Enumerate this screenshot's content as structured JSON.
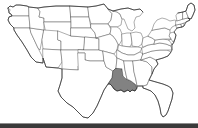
{
  "figure": {
    "kind": "map",
    "width": 198,
    "height": 128,
    "background_color": "#ffffff",
    "border_color": "#4a4a4a",
    "coastline_color": "#2e2e2e",
    "highlight_color": "#828282",
    "bottom_band_color": "#3a3a3a"
  },
  "map_data": {
    "region": "Contiguous United States",
    "projection_note": "simplified outline",
    "highlighted_states": [
      "Louisiana"
    ],
    "highlight_fill": "#828282",
    "default_fill": "#ffffff",
    "states": [
      {
        "code": "WA",
        "name": "Washington",
        "highlighted": false
      },
      {
        "code": "OR",
        "name": "Oregon",
        "highlighted": false
      },
      {
        "code": "CA",
        "name": "California",
        "highlighted": false
      },
      {
        "code": "NV",
        "name": "Nevada",
        "highlighted": false
      },
      {
        "code": "ID",
        "name": "Idaho",
        "highlighted": false
      },
      {
        "code": "MT",
        "name": "Montana",
        "highlighted": false
      },
      {
        "code": "WY",
        "name": "Wyoming",
        "highlighted": false
      },
      {
        "code": "UT",
        "name": "Utah",
        "highlighted": false
      },
      {
        "code": "AZ",
        "name": "Arizona",
        "highlighted": false
      },
      {
        "code": "CO",
        "name": "Colorado",
        "highlighted": false
      },
      {
        "code": "NM",
        "name": "New Mexico",
        "highlighted": false
      },
      {
        "code": "ND",
        "name": "North Dakota",
        "highlighted": false
      },
      {
        "code": "SD",
        "name": "South Dakota",
        "highlighted": false
      },
      {
        "code": "NE",
        "name": "Nebraska",
        "highlighted": false
      },
      {
        "code": "KS",
        "name": "Kansas",
        "highlighted": false
      },
      {
        "code": "OK",
        "name": "Oklahoma",
        "highlighted": false
      },
      {
        "code": "TX",
        "name": "Texas",
        "highlighted": false
      },
      {
        "code": "MN",
        "name": "Minnesota",
        "highlighted": false
      },
      {
        "code": "IA",
        "name": "Iowa",
        "highlighted": false
      },
      {
        "code": "MO",
        "name": "Missouri",
        "highlighted": false
      },
      {
        "code": "AR",
        "name": "Arkansas",
        "highlighted": false
      },
      {
        "code": "LA",
        "name": "Louisiana",
        "highlighted": true
      },
      {
        "code": "WI",
        "name": "Wisconsin",
        "highlighted": false
      },
      {
        "code": "IL",
        "name": "Illinois",
        "highlighted": false
      },
      {
        "code": "MI",
        "name": "Michigan",
        "highlighted": false
      },
      {
        "code": "IN",
        "name": "Indiana",
        "highlighted": false
      },
      {
        "code": "OH",
        "name": "Ohio",
        "highlighted": false
      },
      {
        "code": "KY",
        "name": "Kentucky",
        "highlighted": false
      },
      {
        "code": "TN",
        "name": "Tennessee",
        "highlighted": false
      },
      {
        "code": "MS",
        "name": "Mississippi",
        "highlighted": false
      },
      {
        "code": "AL",
        "name": "Alabama",
        "highlighted": false
      },
      {
        "code": "GA",
        "name": "Georgia",
        "highlighted": false
      },
      {
        "code": "FL",
        "name": "Florida",
        "highlighted": false
      },
      {
        "code": "SC",
        "name": "South Carolina",
        "highlighted": false
      },
      {
        "code": "NC",
        "name": "North Carolina",
        "highlighted": false
      },
      {
        "code": "VA",
        "name": "Virginia",
        "highlighted": false
      },
      {
        "code": "WV",
        "name": "West Virginia",
        "highlighted": false
      },
      {
        "code": "MD",
        "name": "Maryland",
        "highlighted": false
      },
      {
        "code": "DE",
        "name": "Delaware",
        "highlighted": false
      },
      {
        "code": "NJ",
        "name": "New Jersey",
        "highlighted": false
      },
      {
        "code": "PA",
        "name": "Pennsylvania",
        "highlighted": false
      },
      {
        "code": "NY",
        "name": "New York",
        "highlighted": false
      },
      {
        "code": "CT",
        "name": "Connecticut",
        "highlighted": false
      },
      {
        "code": "RI",
        "name": "Rhode Island",
        "highlighted": false
      },
      {
        "code": "MA",
        "name": "Massachusetts",
        "highlighted": false
      },
      {
        "code": "VT",
        "name": "Vermont",
        "highlighted": false
      },
      {
        "code": "NH",
        "name": "New Hampshire",
        "highlighted": false
      },
      {
        "code": "ME",
        "name": "Maine",
        "highlighted": false
      }
    ]
  }
}
